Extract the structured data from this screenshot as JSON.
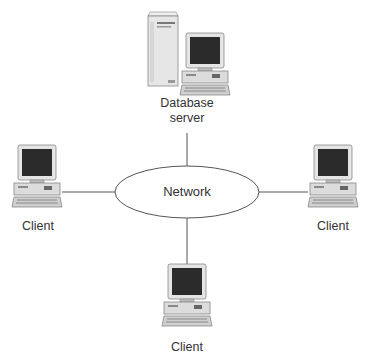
{
  "diagram": {
    "type": "network-topology",
    "center": {
      "label": "Network",
      "shape": "ellipse"
    },
    "nodes": [
      {
        "id": "server",
        "label_line1": "Database",
        "label_line2": "server",
        "icon": "server-workstation-icon",
        "position": "top"
      },
      {
        "id": "client-left",
        "label": "Client",
        "icon": "desktop-computer-icon",
        "position": "left"
      },
      {
        "id": "client-right",
        "label": "Client",
        "icon": "desktop-computer-icon",
        "position": "right"
      },
      {
        "id": "client-bottom",
        "label": "Client",
        "icon": "desktop-computer-icon",
        "position": "bottom"
      }
    ],
    "edges": [
      {
        "from": "server",
        "to": "network"
      },
      {
        "from": "client-left",
        "to": "network"
      },
      {
        "from": "client-right",
        "to": "network"
      },
      {
        "from": "client-bottom",
        "to": "network"
      }
    ],
    "colors": {
      "line": "#555555",
      "screen": "#2a2a2a",
      "case": "#d8d8d8",
      "text": "#333333"
    }
  }
}
